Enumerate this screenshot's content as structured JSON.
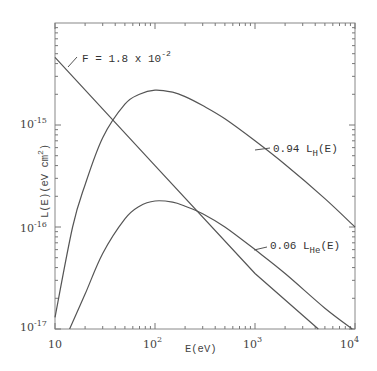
{
  "chart_data": {
    "type": "line",
    "title": "",
    "xlabel": "E(eV)",
    "ylabel": "L(E)(eV cm^2)",
    "xscale": "log",
    "yscale": "log",
    "xlim": [
      10,
      10000
    ],
    "ylim": [
      1e-17,
      1e-14
    ],
    "grid": false,
    "legend": "none (inline annotations)",
    "x_ticks": [
      {
        "value": 10,
        "label": "10"
      },
      {
        "value": 100,
        "label": "10",
        "exp": "2"
      },
      {
        "value": 1000,
        "label": "10",
        "exp": "3"
      },
      {
        "value": 10000,
        "label": "10",
        "exp": "4"
      }
    ],
    "y_ticks": [
      {
        "value": 1e-17,
        "label": "10",
        "exp": "-17"
      },
      {
        "value": 1e-16,
        "label": "10",
        "exp": "-16"
      },
      {
        "value": 1e-15,
        "label": "10",
        "exp": "-15"
      }
    ],
    "series": [
      {
        "name": "F = 1.8 x 10^-2",
        "style": "straight power-law line",
        "x": [
          10,
          100,
          1000,
          4300
        ],
        "y": [
          4.6e-15,
          4e-16,
          3.5e-17,
          1e-17
        ]
      },
      {
        "name": "0.94 L_H(E)",
        "x": [
          10,
          15,
          20,
          30,
          50,
          70,
          100,
          150,
          200,
          300,
          500,
          1000,
          2000,
          5000,
          10000
        ],
        "y": [
          1.3e-17,
          1e-16,
          2.6e-16,
          7.5e-16,
          1.6e-15,
          2e-15,
          2.2e-15,
          2.1e-15,
          1.9e-15,
          1.55e-15,
          1.15e-15,
          7e-16,
          4.1e-16,
          1.9e-16,
          1e-16
        ]
      },
      {
        "name": "0.06 L_He(E)",
        "x": [
          14,
          20,
          30,
          50,
          70,
          100,
          150,
          200,
          300,
          500,
          1000,
          2000,
          5000,
          9400
        ],
        "y": [
          1e-17,
          2.2e-17,
          5.5e-17,
          1.2e-16,
          1.6e-16,
          1.8e-16,
          1.75e-16,
          1.6e-16,
          1.35e-16,
          1e-16,
          6e-17,
          3.5e-17,
          1.6e-17,
          1e-17
        ]
      }
    ],
    "annotations": [
      {
        "text": "F = 1.8 x 10",
        "exp": "-2",
        "target": "F line"
      },
      {
        "text": "0.94 L",
        "sub": "H",
        "suffix": "(E)",
        "target": "H curve"
      },
      {
        "text": "0.06 L",
        "sub": "He",
        "suffix": "(E)",
        "target": "He curve"
      }
    ]
  },
  "labels": {
    "x_axis": "E(eV)",
    "y_axis": "L(E)(eV cm",
    "y_axis_exp": "2",
    "y_axis_close": ")",
    "xt10": "10",
    "xt100": "10",
    "xt100e": "2",
    "xt1000": "10",
    "xt1000e": "3",
    "xt10000": "10",
    "xt10000e": "4",
    "yt17": "10",
    "yt17e": "-17",
    "yt16": "10",
    "yt16e": "-16",
    "yt15": "10",
    "yt15e": "-15",
    "ann_f": "F = 1.8 x 10",
    "ann_f_e": "-2",
    "ann_h": "0.94 L",
    "ann_h_sub": "H",
    "ann_h_suf": "(E)",
    "ann_he": "0.06 L",
    "ann_he_sub": "He",
    "ann_he_suf": "(E)"
  },
  "colors": {
    "line": "#555555",
    "frame": "#777777",
    "background": "#ffffff"
  }
}
